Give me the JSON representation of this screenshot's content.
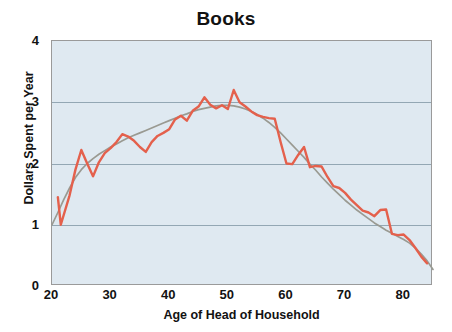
{
  "chart_data": {
    "type": "line",
    "title": "Books",
    "xlabel": "Age of Head of Household",
    "ylabel": "Dollars Spent per Year",
    "xlim": [
      20,
      85
    ],
    "ylim": [
      0,
      4
    ],
    "xticks": [
      20,
      30,
      40,
      50,
      60,
      70,
      80
    ],
    "xticklabels": [
      "20",
      "30",
      "40",
      "50",
      "60",
      "70",
      "80"
    ],
    "yticks": [
      0,
      1,
      2,
      3,
      4
    ],
    "yticklabels": [
      "0",
      "1",
      "2",
      "3",
      "4"
    ],
    "grid": "horizontal",
    "legend": "none",
    "plot_background": "#dfe9f1",
    "series": [
      {
        "name": "observed",
        "color": "#e4604c",
        "width": 2.4,
        "x": [
          21,
          21.5,
          23,
          24,
          25,
          26,
          27,
          28,
          29,
          30,
          31,
          32,
          33,
          34,
          35,
          36,
          37,
          38,
          39,
          40,
          41,
          42,
          43,
          44,
          45,
          46,
          47,
          48,
          49,
          50,
          51,
          52,
          53,
          54,
          55,
          56,
          57,
          58,
          59,
          60,
          61,
          62,
          63,
          64,
          65,
          66,
          67,
          68,
          69,
          70,
          71,
          72,
          73,
          74,
          75,
          76,
          77,
          78,
          79,
          80,
          81,
          82,
          83,
          84
        ],
        "y": [
          1.45,
          1.0,
          1.48,
          1.9,
          2.22,
          2.0,
          1.79,
          2.02,
          2.17,
          2.25,
          2.35,
          2.48,
          2.44,
          2.37,
          2.27,
          2.19,
          2.35,
          2.45,
          2.5,
          2.56,
          2.72,
          2.78,
          2.7,
          2.86,
          2.93,
          3.08,
          2.96,
          2.9,
          2.95,
          2.89,
          3.2,
          3.0,
          2.93,
          2.85,
          2.79,
          2.76,
          2.74,
          2.73,
          2.35,
          2.0,
          1.99,
          2.14,
          2.27,
          1.94,
          1.96,
          1.95,
          1.78,
          1.63,
          1.6,
          1.52,
          1.41,
          1.32,
          1.23,
          1.2,
          1.14,
          1.24,
          1.25,
          0.85,
          0.83,
          0.84,
          0.75,
          0.62,
          0.48,
          0.37
        ]
      },
      {
        "name": "smoothed-trend",
        "color": "#9a9a92",
        "width": 1.7,
        "x": [
          20,
          21,
          22,
          23,
          24,
          25,
          26,
          27,
          28,
          29,
          30,
          31,
          32,
          33,
          34,
          35,
          36,
          37,
          38,
          39,
          40,
          41,
          42,
          43,
          44,
          45,
          46,
          47,
          48,
          49,
          50,
          51,
          52,
          53,
          54,
          55,
          56,
          57,
          58,
          59,
          60,
          61,
          62,
          63,
          64,
          65,
          66,
          67,
          68,
          69,
          70,
          71,
          72,
          73,
          74,
          75,
          76,
          77,
          78,
          79,
          80,
          81,
          82,
          83,
          84,
          85
        ],
        "y": [
          1.0,
          1.2,
          1.41,
          1.6,
          1.77,
          1.9,
          2.0,
          2.08,
          2.15,
          2.21,
          2.27,
          2.32,
          2.37,
          2.42,
          2.46,
          2.5,
          2.54,
          2.58,
          2.62,
          2.66,
          2.7,
          2.74,
          2.78,
          2.81,
          2.85,
          2.88,
          2.9,
          2.92,
          2.94,
          2.95,
          2.95,
          2.94,
          2.92,
          2.89,
          2.85,
          2.8,
          2.74,
          2.67,
          2.59,
          2.5,
          2.4,
          2.3,
          2.2,
          2.1,
          1.99,
          1.89,
          1.78,
          1.68,
          1.58,
          1.49,
          1.4,
          1.32,
          1.24,
          1.17,
          1.1,
          1.03,
          0.97,
          0.91,
          0.86,
          0.81,
          0.76,
          0.7,
          0.62,
          0.52,
          0.41,
          0.27
        ]
      }
    ]
  }
}
